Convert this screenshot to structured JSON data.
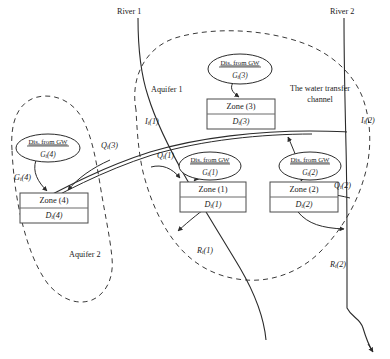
{
  "figure": {
    "type": "schematic-diagram",
    "background_color": "#ffffff",
    "line_color": "#2b2b2b",
    "dashed_boundary_color": "#3a3a3a"
  },
  "labels": {
    "river_1": "River 1",
    "river_2": "River 2",
    "aquifer_1": "Aquifer 1",
    "aquifer_2": "Aquifer 2",
    "transfer_channel": "The water transfer",
    "transfer_channel_line2": "channel"
  },
  "gw_nodes": [
    {
      "id": "gw3",
      "top": "Dis. from GW",
      "symbol": "G",
      "sub": "t",
      "index": "(3)",
      "cx": 240,
      "cy": 69
    },
    {
      "id": "gw1",
      "top": "Dis. from GW",
      "symbol": "G",
      "sub": "t",
      "index": "(1)",
      "cx": 210,
      "cy": 166
    },
    {
      "id": "gw2",
      "top": "Dis. from GW",
      "symbol": "G",
      "sub": "t",
      "index": "(2)",
      "cx": 310,
      "cy": 166
    },
    {
      "id": "gw4",
      "top": "Dis. from GW",
      "symbol": "G",
      "sub": "t",
      "index": "(4)",
      "cx": 48,
      "cy": 148
    }
  ],
  "zone_boxes": [
    {
      "id": "zone3",
      "zone_label": "Zone (3)",
      "demand_symbol": "D",
      "demand_sub": "t",
      "demand_index": "(3)",
      "x": 207,
      "y": 99,
      "w": 68,
      "h": 30
    },
    {
      "id": "zone1",
      "zone_label": "Zone (1)",
      "demand_symbol": "D",
      "demand_sub": "t",
      "demand_index": "(1)",
      "x": 180,
      "y": 182,
      "w": 66,
      "h": 30
    },
    {
      "id": "zone2",
      "zone_label": "Zone (2)",
      "demand_symbol": "D",
      "demand_sub": "t",
      "demand_index": "(2)",
      "x": 270,
      "y": 182,
      "w": 68,
      "h": 30
    },
    {
      "id": "zone4",
      "zone_label": "Zone (4)",
      "demand_symbol": "D",
      "demand_sub": "t",
      "demand_index": "(4)",
      "x": 20,
      "y": 193,
      "w": 68,
      "h": 30
    }
  ],
  "flow_labels": [
    {
      "id": "It1",
      "symbol": "I",
      "sub": "t",
      "index": "(1)",
      "x": 145,
      "y": 122
    },
    {
      "id": "It2",
      "symbol": "I",
      "sub": "t",
      "index": "(2)",
      "x": 361,
      "y": 121
    },
    {
      "id": "Qt3",
      "symbol": "Q",
      "sub": "t",
      "index": "(3)",
      "x": 101,
      "y": 146
    },
    {
      "id": "Qt1",
      "symbol": "Q",
      "sub": "t",
      "index": "(1)",
      "x": 157,
      "y": 156
    },
    {
      "id": "Qt2",
      "symbol": "Q",
      "sub": "t",
      "index": "(2)",
      "x": 334,
      "y": 186
    },
    {
      "id": "Gt4",
      "symbol": "G",
      "sub": "t",
      "index": "(4)",
      "x": 14,
      "y": 178
    },
    {
      "id": "Rt1",
      "symbol": "R",
      "sub": "t",
      "index": "(1)",
      "x": 197,
      "y": 251
    },
    {
      "id": "Rt2",
      "symbol": "R",
      "sub": "t",
      "index": "(2)",
      "x": 330,
      "y": 265
    }
  ]
}
